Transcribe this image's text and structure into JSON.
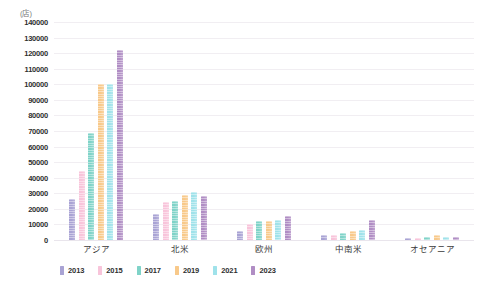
{
  "chart_data": {
    "type": "bar",
    "title": "",
    "subtitle": "",
    "unit_label": "(店)",
    "xlabel": "",
    "ylabel": "",
    "ylim": [
      0,
      140000
    ],
    "ytick_step": 10000,
    "grid": true,
    "legend_position": "bottom-left",
    "categories": [
      "アジア",
      "北米",
      "欧州",
      "中南米",
      "オセアニア"
    ],
    "ytick_labels": [
      "140000",
      "130000",
      "120000",
      "110000",
      "100000",
      "90000",
      "80000",
      "70000",
      "60000",
      "50000",
      "40000",
      "30000",
      "20000",
      "10000",
      "0"
    ],
    "series": [
      {
        "name": "2013",
        "color": "#a9a3d4",
        "values": [
          26500,
          16500,
          5500,
          3000,
          1300
        ]
      },
      {
        "name": "2015",
        "color": "#f8c4da",
        "values": [
          44500,
          24500,
          10300,
          3500,
          1300
        ]
      },
      {
        "name": "2017",
        "color": "#7fd3c8",
        "values": [
          69000,
          24800,
          12000,
          4500,
          1800
        ]
      },
      {
        "name": "2019",
        "color": "#f8c98a",
        "values": [
          100000,
          29000,
          12200,
          6000,
          3500
        ]
      },
      {
        "name": "2021",
        "color": "#9fe2ea",
        "values": [
          100500,
          31000,
          12800,
          6300,
          2000
        ]
      },
      {
        "name": "2023",
        "color": "#b08dc4",
        "values": [
          122000,
          28000,
          15700,
          13000,
          2000
        ]
      }
    ]
  }
}
